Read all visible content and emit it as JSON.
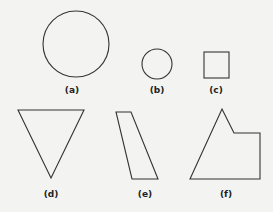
{
  "figures": [
    {
      "id": "a",
      "label": "(a)",
      "shape": "large-circle"
    },
    {
      "id": "b",
      "label": "(b)",
      "shape": "small-circle"
    },
    {
      "id": "c",
      "label": "(c)",
      "shape": "square"
    },
    {
      "id": "d",
      "label": "(d)",
      "shape": "inverted-triangle"
    },
    {
      "id": "e",
      "label": "(e)",
      "shape": "parallelogram"
    },
    {
      "id": "f",
      "label": "(f)",
      "shape": "pentagon-irregular"
    }
  ],
  "colors": {
    "stroke": "#333333",
    "background": "#f3f3f1"
  }
}
